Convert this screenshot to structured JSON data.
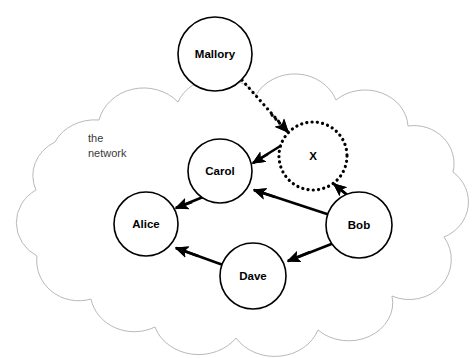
{
  "diagram": {
    "title": "the network",
    "cloud_label_lines": [
      "the",
      "network"
    ],
    "background_color": "#ffffff",
    "cloud_stroke_color": "#b9b9bd",
    "node_stroke_color": "#000000",
    "edge_color": "#000000",
    "nodes": [
      {
        "id": "mallory",
        "label": "Mallory",
        "cx": 215,
        "cy": 54,
        "r": 37,
        "style": "solid",
        "inside_cloud": false
      },
      {
        "id": "x",
        "label": "X",
        "cx": 313,
        "cy": 156,
        "r": 34,
        "style": "dotted",
        "inside_cloud": true
      },
      {
        "id": "carol",
        "label": "Carol",
        "cx": 220,
        "cy": 171,
        "r": 32,
        "style": "solid",
        "inside_cloud": true
      },
      {
        "id": "alice",
        "label": "Alice",
        "cx": 146,
        "cy": 224,
        "r": 32,
        "style": "solid",
        "inside_cloud": true
      },
      {
        "id": "bob",
        "label": "Bob",
        "cx": 359,
        "cy": 225,
        "r": 33,
        "style": "solid",
        "inside_cloud": true
      },
      {
        "id": "dave",
        "label": "Dave",
        "cx": 253,
        "cy": 276,
        "r": 33,
        "style": "solid",
        "inside_cloud": true
      }
    ],
    "edges": [
      {
        "id": "mallory-to-x",
        "from": "mallory",
        "to": "x",
        "style": "dotted",
        "arrow": "to"
      },
      {
        "id": "x-to-carol",
        "from": "x",
        "to": "carol",
        "style": "solid",
        "arrow": "to"
      },
      {
        "id": "bob-to-x",
        "from": "bob",
        "to": "x",
        "style": "solid",
        "arrow": "to"
      },
      {
        "id": "bob-to-carol",
        "from": "bob",
        "to": "carol",
        "style": "solid",
        "arrow": "to"
      },
      {
        "id": "carol-to-alice",
        "from": "carol",
        "to": "alice",
        "style": "solid",
        "arrow": "to"
      },
      {
        "id": "bob-to-dave",
        "from": "bob",
        "to": "dave",
        "style": "solid",
        "arrow": "to"
      },
      {
        "id": "dave-to-alice",
        "from": "dave",
        "to": "alice",
        "style": "solid",
        "arrow": "to"
      }
    ],
    "cloud_label_position": {
      "x": 88,
      "y": 142
    }
  }
}
